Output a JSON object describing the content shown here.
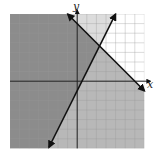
{
  "figure": {
    "type": "system-of-linear-inequalities-graph",
    "x_axis_label": "x",
    "y_axis_label": "y",
    "grid": {
      "xmin": -7,
      "xmax": 7,
      "ymin": -7,
      "ymax": 7,
      "step": 1
    },
    "lines": [
      {
        "name": "line-1",
        "equation": "y = 2x - 1",
        "slope": 2,
        "intercept": -1,
        "style": "solid",
        "shaded_side": "left/above"
      },
      {
        "name": "line-2",
        "equation": "y = -x + 6",
        "slope": -1,
        "intercept": 6,
        "style": "solid",
        "shaded_side": "below"
      }
    ],
    "intersection": {
      "x": 2.33,
      "y": 3.67
    },
    "colors": {
      "overlap_region": "#8c8c8c",
      "line1_only_region": "#dcdcdc",
      "line2_only_region": "#b8b8b8",
      "unshaded_region": "#ffffff",
      "grid_line": "#999999",
      "axis": "#222222",
      "boundary_line": "#111111"
    }
  }
}
